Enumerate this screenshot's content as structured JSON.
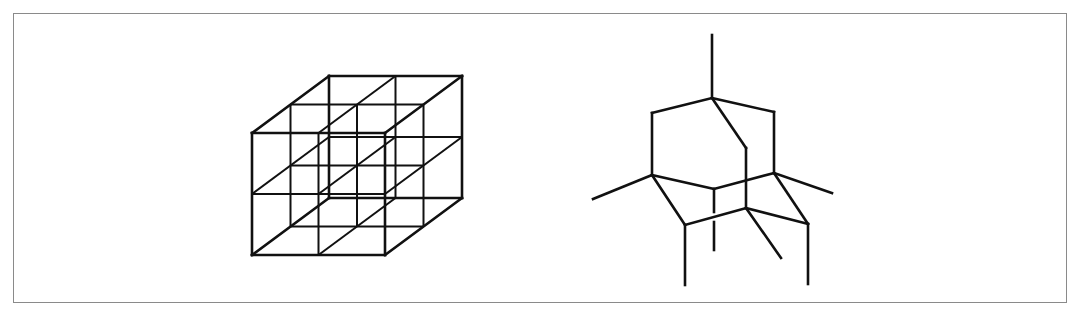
{
  "figure": {
    "frame": {
      "x": 13,
      "y": 13,
      "width": 1054,
      "height": 290,
      "border_color": "#8a8a8a"
    },
    "line_color": "#111111",
    "panels": [
      {
        "name": "cube-lattice",
        "description": "2x2x2 cubic lattice wireframe",
        "origin_front_bottom_left": [
          252,
          255
        ],
        "cell_width": 66.5,
        "cell_height": 61,
        "depth_dx": 38.5,
        "depth_dy": -28.5,
        "cells": [
          2,
          2,
          2
        ]
      },
      {
        "name": "adamantane-skeleton",
        "description": "Adamantane-like molecular skeleton with substituent bonds",
        "vertices": {
          "T": [
            712,
            98
          ],
          "UL": [
            652,
            113
          ],
          "UR": [
            774,
            112
          ],
          "M": [
            746,
            148
          ],
          "L": [
            652,
            175
          ],
          "C": [
            714,
            189
          ],
          "R": [
            774,
            173
          ],
          "B": [
            746,
            208
          ],
          "LL": [
            685,
            225
          ],
          "LR": [
            808,
            224
          ]
        },
        "bonds": [
          [
            "T",
            "UL"
          ],
          [
            "T",
            "UR"
          ],
          [
            "T",
            "M"
          ],
          [
            "UL",
            "L"
          ],
          [
            "UR",
            "R"
          ],
          [
            "L",
            "C"
          ],
          [
            "C",
            "R"
          ],
          [
            "M",
            "B"
          ],
          [
            "L",
            "LL"
          ],
          [
            "LL",
            "B"
          ],
          [
            "B",
            "LR"
          ],
          [
            "R",
            "LR"
          ]
        ],
        "stubs": [
          [
            [
              712,
              35
            ],
            [
              712,
              98
            ]
          ],
          [
            [
              593,
              199
            ],
            [
              652,
              175
            ]
          ],
          [
            [
              774,
              173
            ],
            [
              832,
              193
            ]
          ],
          [
            [
              685,
              225
            ],
            [
              685,
              285
            ]
          ],
          [
            [
              808,
              224
            ],
            [
              808,
              284
            ]
          ],
          [
            [
              746,
              208
            ],
            [
              781,
              258
            ]
          ],
          [
            [
              714,
              189
            ],
            [
              714,
              212
            ]
          ],
          [
            [
              714,
              222
            ],
            [
              714,
              250
            ]
          ]
        ]
      }
    ]
  }
}
